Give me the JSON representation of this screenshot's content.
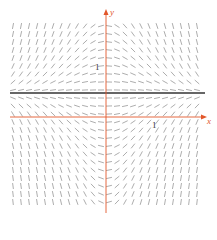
{
  "diagram": {
    "type": "slope-field",
    "equation_slope": "x*(1-2y)",
    "axes": {
      "x_label": "x",
      "y_label": "y",
      "x_tick_label": "1",
      "y_tick_label": "1",
      "color": "#e2572a"
    },
    "equilibrium_line": {
      "y": 0.5,
      "color": "#333333"
    },
    "origin_px": [
      106,
      117
    ],
    "unit_px": 48,
    "grid": {
      "x_start": 13,
      "x_end": 200,
      "y_start": 26,
      "y_end": 205,
      "spacing": 8
    },
    "segment_color": "#8a8a8a",
    "segment_length": 6
  }
}
